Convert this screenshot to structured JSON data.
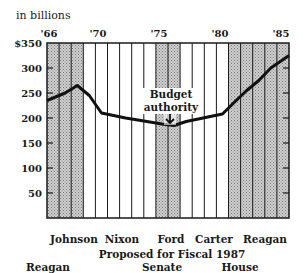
{
  "chart_data": {
    "type": "line",
    "title": "",
    "ylabel": "in billions",
    "xlabel": "",
    "ylim": [
      0,
      350
    ],
    "yticks": [
      "$350",
      "300",
      "250",
      "200",
      "150",
      "100",
      "50"
    ],
    "xtick_labels": [
      "'66",
      "'70",
      "'75",
      "'80",
      "'85"
    ],
    "x": [
      1966,
      1967,
      1968,
      1969,
      1970,
      1971,
      1972,
      1973,
      1974,
      1975,
      1976,
      1977,
      1978,
      1979,
      1980,
      1981,
      1982,
      1983,
      1984,
      1985
    ],
    "series": [
      {
        "name": "Budget authority",
        "values": [
          235,
          250,
          265,
          245,
          210,
          205,
          200,
          196,
          192,
          188,
          185,
          193,
          198,
          203,
          208,
          232,
          255,
          275,
          300,
          325
        ]
      }
    ],
    "shaded_periods": [
      {
        "label": "Johnson",
        "from": 1966,
        "to": 1968,
        "shaded": true
      },
      {
        "label": "Nixon",
        "from": 1969,
        "to": 1974,
        "shaded": false
      },
      {
        "label": "Ford",
        "from": 1975,
        "to": 1976,
        "shaded": true
      },
      {
        "label": "Carter",
        "from": 1977,
        "to": 1980,
        "shaded": false
      },
      {
        "label": "Reagan",
        "from": 1981,
        "to": 1985,
        "shaded": true
      }
    ],
    "annotations": [
      {
        "text": "Budget authority",
        "x": 1975,
        "y": 188
      }
    ],
    "grid": false,
    "footer": {
      "heading": "Proposed for Fiscal 1987",
      "columns": [
        "Reagan",
        "Senate",
        "House"
      ]
    }
  },
  "labels": {
    "unit": "in billions",
    "annotation_line1": "Budget",
    "annotation_line2": "authority",
    "years": [
      "'66",
      "'70",
      "'75",
      "'80",
      "'85"
    ],
    "yticks": [
      "$350",
      "300",
      "250",
      "200",
      "150",
      "100",
      "50"
    ],
    "presidents": [
      "Johnson",
      "Nixon",
      "Ford",
      "Carter",
      "Reagan"
    ],
    "proposed_heading": "Proposed for Fiscal 1987",
    "proposed_columns": [
      "Reagan",
      "Senate",
      "House"
    ]
  }
}
